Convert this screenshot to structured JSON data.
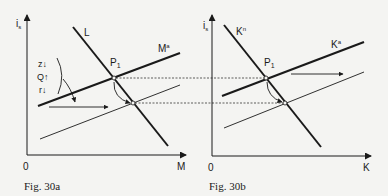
{
  "figures": [
    {
      "id": "fig30a",
      "caption": "Fig. 30a",
      "y_axis_label": "i",
      "y_axis_subscript": "s",
      "x_axis_label": "M",
      "origin_label": "0",
      "curves": {
        "downward_label": "L",
        "upward_label": "M",
        "upward_superscript": "a",
        "equilibrium_label": "P",
        "equilibrium_subscript": "1"
      },
      "annotations": {
        "z": "z↓",
        "q": "Q↑",
        "r": "r↓"
      }
    },
    {
      "id": "fig30b",
      "caption": "Fig. 30b",
      "y_axis_label": "i",
      "y_axis_subscript": "s",
      "x_axis_label": "K",
      "origin_label": "0",
      "curves": {
        "downward_label": "K",
        "downward_superscript": "n",
        "upward_label": "K",
        "upward_superscript": "a",
        "equilibrium_label": "P",
        "equilibrium_subscript": "1"
      }
    }
  ],
  "colors": {
    "background": "#f4f4f2",
    "ink": "#1a1a1a"
  }
}
